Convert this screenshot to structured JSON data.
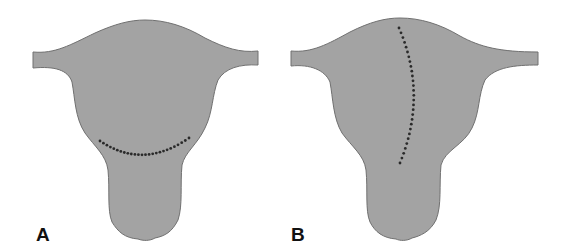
{
  "figure": {
    "panels": [
      {
        "label": "A",
        "incision": "transverse-lower-segment"
      },
      {
        "label": "B",
        "incision": "vertical-fundal-to-body"
      }
    ],
    "colors": {
      "organ_fill": "#a3a3a3",
      "organ_outline": "#707070",
      "dots": "#2a2a2a",
      "label": "#111111"
    }
  }
}
